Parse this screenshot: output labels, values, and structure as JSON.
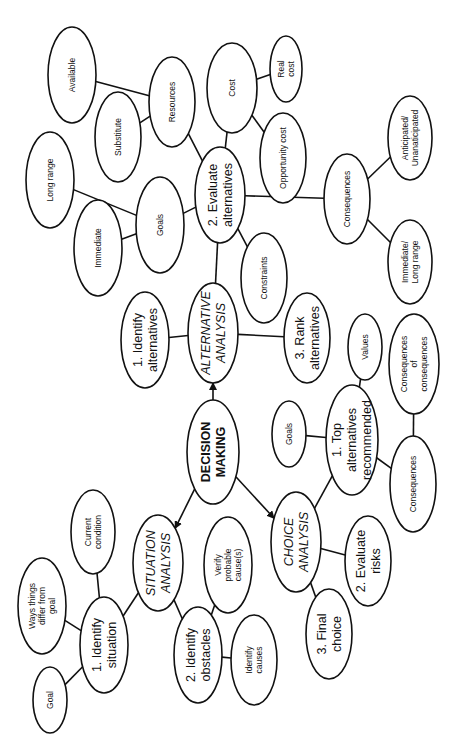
{
  "orientation": "rotated 90 degrees counter-clockwise",
  "nodes": [
    {
      "id": "root",
      "label": [
        "DECISION",
        "MAKING"
      ],
      "kind": "root"
    },
    {
      "id": "alt",
      "label": [
        "ALTERNATIVE",
        "ANALYSIS"
      ],
      "kind": "major"
    },
    {
      "id": "sit",
      "label": [
        "SITUATION",
        "ANALYSIS"
      ],
      "kind": "major"
    },
    {
      "id": "cho",
      "label": [
        "CHOICE",
        "ANALYSIS"
      ],
      "kind": "major"
    },
    {
      "id": "idalt",
      "label": [
        "1. Identify",
        "alternatives"
      ],
      "kind": "medium"
    },
    {
      "id": "evalt",
      "label": [
        "2. Evaluate",
        "alternatives"
      ],
      "kind": "medium"
    },
    {
      "id": "rank",
      "label": [
        "3. Rank",
        "alternatives"
      ],
      "kind": "medium"
    },
    {
      "id": "goalsA",
      "label": [
        "Goals"
      ],
      "kind": "small"
    },
    {
      "id": "immediate",
      "label": [
        "Immediate"
      ],
      "kind": "small"
    },
    {
      "id": "longrange",
      "label": [
        "Long range"
      ],
      "kind": "small"
    },
    {
      "id": "resources",
      "label": [
        "Resources"
      ],
      "kind": "small"
    },
    {
      "id": "substitute",
      "label": [
        "Substitute"
      ],
      "kind": "small"
    },
    {
      "id": "available",
      "label": [
        "Available"
      ],
      "kind": "small"
    },
    {
      "id": "cost",
      "label": [
        "Cost"
      ],
      "kind": "small"
    },
    {
      "id": "realcost",
      "label": [
        "Real",
        "cost"
      ],
      "kind": "small"
    },
    {
      "id": "oppcost",
      "label": [
        "Opportunity cost"
      ],
      "kind": "small"
    },
    {
      "id": "consA",
      "label": [
        "Consequences"
      ],
      "kind": "small"
    },
    {
      "id": "antic",
      "label": [
        "Anticipated/",
        "Unanaticipated"
      ],
      "kind": "small"
    },
    {
      "id": "immlong",
      "label": [
        "Immediate/",
        "Long range"
      ],
      "kind": "small"
    },
    {
      "id": "constraints",
      "label": [
        "Constraints"
      ],
      "kind": "small"
    },
    {
      "id": "idsit",
      "label": [
        "1. Identify",
        "situation"
      ],
      "kind": "medium"
    },
    {
      "id": "idobs",
      "label": [
        "2. Identify",
        "obstacles"
      ],
      "kind": "medium"
    },
    {
      "id": "curcond",
      "label": [
        "Current",
        "condition"
      ],
      "kind": "small"
    },
    {
      "id": "ways",
      "label": [
        "Ways things",
        "differ from",
        "goal"
      ],
      "kind": "small"
    },
    {
      "id": "goal",
      "label": [
        "Goal"
      ],
      "kind": "small"
    },
    {
      "id": "verify",
      "label": [
        "Verify",
        "probable",
        "cause(s)"
      ],
      "kind": "small"
    },
    {
      "id": "idcauses",
      "label": [
        "Identify",
        "causes"
      ],
      "kind": "small"
    },
    {
      "id": "topalt",
      "label": [
        "1. Top",
        "alternatives",
        "recommended"
      ],
      "kind": "medium"
    },
    {
      "id": "evrisk",
      "label": [
        "2. Evaluate",
        "risks"
      ],
      "kind": "medium"
    },
    {
      "id": "final",
      "label": [
        "3. Final",
        "choice"
      ],
      "kind": "medium"
    },
    {
      "id": "goalsC",
      "label": [
        "Goals"
      ],
      "kind": "small"
    },
    {
      "id": "values",
      "label": [
        "Values"
      ],
      "kind": "small"
    },
    {
      "id": "consC",
      "label": [
        "Consequences"
      ],
      "kind": "small"
    },
    {
      "id": "consofcons",
      "label": [
        "Consequences",
        "of",
        "consequences"
      ],
      "kind": "small"
    }
  ],
  "edges": [
    {
      "from": "root",
      "to": "alt",
      "arrow": true
    },
    {
      "from": "root",
      "to": "sit",
      "arrow": true
    },
    {
      "from": "root",
      "to": "cho",
      "arrow": true
    },
    {
      "from": "alt",
      "to": "idalt"
    },
    {
      "from": "alt",
      "to": "evalt"
    },
    {
      "from": "alt",
      "to": "rank"
    },
    {
      "from": "evalt",
      "to": "goalsA"
    },
    {
      "from": "goalsA",
      "to": "immediate"
    },
    {
      "from": "goalsA",
      "to": "longrange"
    },
    {
      "from": "evalt",
      "to": "resources"
    },
    {
      "from": "resources",
      "to": "substitute"
    },
    {
      "from": "resources",
      "to": "available"
    },
    {
      "from": "evalt",
      "to": "cost"
    },
    {
      "from": "cost",
      "to": "realcost"
    },
    {
      "from": "cost",
      "to": "oppcost"
    },
    {
      "from": "evalt",
      "to": "consA"
    },
    {
      "from": "consA",
      "to": "antic"
    },
    {
      "from": "consA",
      "to": "immlong"
    },
    {
      "from": "evalt",
      "to": "constraints"
    },
    {
      "from": "sit",
      "to": "idsit"
    },
    {
      "from": "sit",
      "to": "idobs"
    },
    {
      "from": "idsit",
      "to": "curcond"
    },
    {
      "from": "idsit",
      "to": "ways"
    },
    {
      "from": "idsit",
      "to": "goal"
    },
    {
      "from": "idobs",
      "to": "verify"
    },
    {
      "from": "idobs",
      "to": "idcauses"
    },
    {
      "from": "cho",
      "to": "topalt"
    },
    {
      "from": "cho",
      "to": "evrisk"
    },
    {
      "from": "cho",
      "to": "final"
    },
    {
      "from": "topalt",
      "to": "goalsC"
    },
    {
      "from": "topalt",
      "to": "values"
    },
    {
      "from": "topalt",
      "to": "consC"
    },
    {
      "from": "consC",
      "to": "consofcons"
    }
  ]
}
